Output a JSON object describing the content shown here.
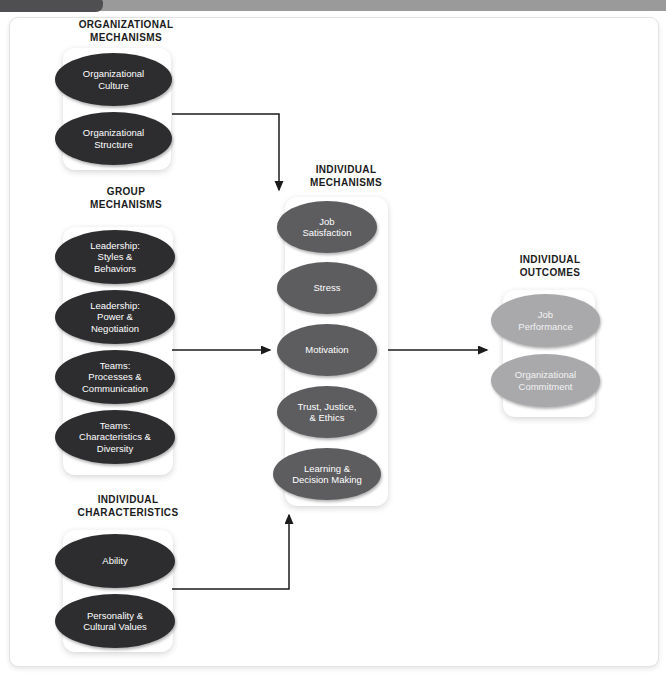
{
  "window": {
    "tab_label": "",
    "bar_color": "#9a9a9a",
    "tab_color": "#4f4f52"
  },
  "diagram": {
    "palette": {
      "dark_oval": "#2d2d30",
      "mid_oval": "#5d5d60",
      "light_oval": "#a9a9ac",
      "panel": "#ffffff",
      "connector": "#1b1b1b",
      "heading_text": "#1b1b1b",
      "oval_text": "#ffffff"
    },
    "groups": [
      {
        "id": "organizational-mechanisms",
        "heading": "ORGANIZATIONAL\nMECHANISMS",
        "tone": "dark",
        "nodes": [
          {
            "label": "Organizational\nCulture"
          },
          {
            "label": "Organizational\nStructure"
          }
        ]
      },
      {
        "id": "group-mechanisms",
        "heading": "GROUP\nMECHANISMS",
        "tone": "dark",
        "nodes": [
          {
            "label": "Leadership:\nStyles &\nBehaviors"
          },
          {
            "label": "Leadership:\nPower &\nNegotiation"
          },
          {
            "label": "Teams:\nProcesses &\nCommunication"
          },
          {
            "label": "Teams:\nCharacteristics &\nDiversity"
          }
        ]
      },
      {
        "id": "individual-characteristics",
        "heading": "INDIVIDUAL\nCHARACTERISTICS",
        "tone": "dark",
        "nodes": [
          {
            "label": "Ability"
          },
          {
            "label": "Personality &\nCultural Values"
          }
        ]
      },
      {
        "id": "individual-mechanisms",
        "heading": "INDIVIDUAL\nMECHANISMS",
        "tone": "mid",
        "nodes": [
          {
            "label": "Job\nSatisfaction"
          },
          {
            "label": "Stress"
          },
          {
            "label": "Motivation"
          },
          {
            "label": "Trust, Justice,\n& Ethics"
          },
          {
            "label": "Learning &\nDecision Making"
          }
        ]
      },
      {
        "id": "individual-outcomes",
        "heading": "INDIVIDUAL\nOUTCOMES",
        "tone": "light",
        "nodes": [
          {
            "label": "Job\nPerformance"
          },
          {
            "label": "Organizational\nCommitment"
          }
        ]
      }
    ],
    "connectors": [
      {
        "id": "org-mechanisms-to-individual-mechanisms",
        "from": "organizational-mechanisms",
        "to": "individual-mechanisms",
        "style": "elbow-right-down"
      },
      {
        "id": "group-mechanisms-to-individual-mechanisms",
        "from": "group-mechanisms",
        "to": "individual-mechanisms",
        "style": "straight-right"
      },
      {
        "id": "individual-characteristics-to-individual-mechanisms",
        "from": "individual-characteristics",
        "to": "individual-mechanisms",
        "style": "elbow-right-up"
      },
      {
        "id": "individual-mechanisms-to-individual-outcomes",
        "from": "individual-mechanisms",
        "to": "individual-outcomes",
        "style": "straight-right"
      }
    ]
  }
}
